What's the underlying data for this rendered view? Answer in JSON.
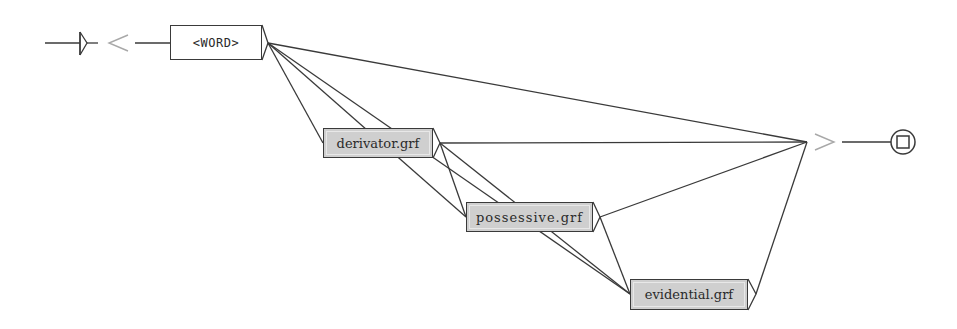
{
  "diagram": {
    "type": "unitex-grammar-graph",
    "nodes": [
      {
        "id": "start",
        "kind": "initial-state"
      },
      {
        "id": "word",
        "label": "<WORD>",
        "kind": "box",
        "x": 170,
        "y": 25,
        "w": 92,
        "h": 35
      },
      {
        "id": "derivator",
        "label": "derivator.grf",
        "kind": "subgraph",
        "x": 323,
        "y": 128,
        "w": 110,
        "h": 30
      },
      {
        "id": "possessive",
        "label": "possessive.grf",
        "kind": "subgraph",
        "x": 466,
        "y": 202,
        "w": 127,
        "h": 30
      },
      {
        "id": "evidential",
        "label": "evidential.grf",
        "kind": "subgraph",
        "x": 630,
        "y": 279,
        "w": 118,
        "h": 31
      },
      {
        "id": "final",
        "kind": "final-state"
      }
    ],
    "markers": {
      "context_open": "<",
      "context_close": ">"
    },
    "edges": [
      {
        "from": "start",
        "to": "word"
      },
      {
        "from": "word",
        "to": "final"
      },
      {
        "from": "word",
        "to": "derivator"
      },
      {
        "from": "word",
        "to": "possessive"
      },
      {
        "from": "word",
        "to": "evidential"
      },
      {
        "from": "derivator",
        "to": "final"
      },
      {
        "from": "derivator",
        "to": "possessive"
      },
      {
        "from": "derivator",
        "to": "evidential"
      },
      {
        "from": "possessive",
        "to": "final"
      },
      {
        "from": "possessive",
        "to": "evidential"
      },
      {
        "from": "evidential",
        "to": "final"
      }
    ],
    "colors": {
      "line": "#3a3a3a",
      "subgraph_fill": "#cfcfcf",
      "marker": "#a8a8a8"
    }
  }
}
